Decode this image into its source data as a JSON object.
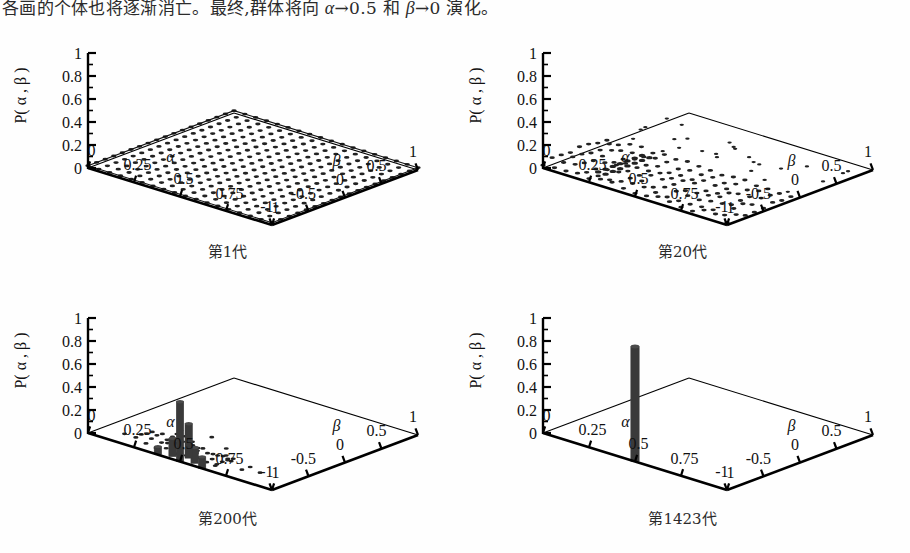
{
  "paragraph": {
    "prefix": "各画的个体也将逐渐消亡。最终,群体将向 ",
    "sym1": "α",
    "mid1": "→0.5 和 ",
    "sym2": "β",
    "mid2": "→0 演化。",
    "full_text": "各画的个体也将逐渐消亡。最终,群体将向 α→0.5 和 β→0 演化。"
  },
  "axes": {
    "z_label": "P( α , β )",
    "x_label": "α",
    "y_label": "β",
    "z_ticks": [
      "1",
      "0.8",
      "0.6",
      "0.4",
      "0.2",
      "0"
    ],
    "z_tick_values": [
      1,
      0.8,
      0.6,
      0.4,
      0.2,
      0
    ],
    "x_ticks": [
      "0",
      "0.25",
      "0.5",
      "0.75",
      "1"
    ],
    "x_tick_values": [
      0,
      0.25,
      0.5,
      0.75,
      1
    ],
    "y_ticks": [
      "-1",
      "-0.5",
      "0",
      "0.5",
      "1"
    ],
    "y_tick_values": [
      -1,
      -0.5,
      0,
      0.5,
      1
    ],
    "zlim": [
      0,
      1
    ],
    "xlim": [
      0,
      1
    ],
    "ylim": [
      -1,
      1
    ],
    "grid": false
  },
  "panels": [
    {
      "caption": "第1代",
      "generation": 1
    },
    {
      "caption": "第20代",
      "generation": 20
    },
    {
      "caption": "第200代",
      "generation": 200
    },
    {
      "caption": "第1423代",
      "generation": 1423
    }
  ],
  "colors": {
    "ink": "#111111",
    "bar_fill": "#3a3a3a",
    "marker": "#222222",
    "frame": "#000000",
    "page": "#ffffff"
  },
  "chart_data": [
    {
      "type": "bar",
      "title": "第1代",
      "xlabel": "α",
      "ylabel": "β",
      "zlabel": "P( α , β )",
      "xlim": [
        0,
        1
      ],
      "ylim": [
        -1,
        1
      ],
      "zlim": [
        0,
        1
      ],
      "grid": false,
      "description": "Uniform near-zero distribution: every (alpha,beta) cell holds the same very small probability, so the surface is a flat dotted sheet lying on the base plane.",
      "nx": 17,
      "ny": 17,
      "uniform_value": 0.02,
      "peak": {
        "alpha": null,
        "beta": null,
        "value": 0.02
      }
    },
    {
      "type": "bar",
      "title": "第20代",
      "xlabel": "α",
      "ylabel": "β",
      "zlabel": "P( α , β )",
      "xlim": [
        0,
        1
      ],
      "ylim": [
        -1,
        1
      ],
      "zlim": [
        0,
        1
      ],
      "grid": false,
      "description": "Probability mass has begun to concentrate toward smaller beta; a dense dotted patch fills the low-beta half while isolated specks remain elsewhere.",
      "nx": 17,
      "ny": 17,
      "dense_region": {
        "beta_range": [
          -1,
          -0.1
        ],
        "alpha_range": [
          0,
          1
        ],
        "value": 0.04
      },
      "sparse_specks": 26,
      "peak": {
        "alpha": 0.5,
        "beta": -0.75,
        "value": 0.1
      }
    },
    {
      "type": "bar",
      "title": "第200代",
      "xlabel": "α",
      "ylabel": "β",
      "zlabel": "P( α , β )",
      "xlim": [
        0,
        1
      ],
      "ylim": [
        -1,
        1
      ],
      "zlim": [
        0,
        1
      ],
      "grid": false,
      "description": "A sharp cluster of tall bars has formed around alpha = 0.5, beta = -1; the tallest bar reaches about 0.5 while surrounding cells keep small residual mass.",
      "bars": [
        {
          "alpha": 0.5,
          "beta": -1.0,
          "value": 0.52
        },
        {
          "alpha": 0.5,
          "beta": -0.88,
          "value": 0.3
        },
        {
          "alpha": 0.44,
          "beta": -0.95,
          "value": 0.16
        },
        {
          "alpha": 0.56,
          "beta": -0.95,
          "value": 0.14
        },
        {
          "alpha": 0.62,
          "beta": -1.0,
          "value": 0.1
        },
        {
          "alpha": 0.38,
          "beta": -1.0,
          "value": 0.07
        }
      ],
      "sparse_specks": 20,
      "peak": {
        "alpha": 0.5,
        "beta": -1.0,
        "value": 0.52
      }
    },
    {
      "type": "bar",
      "title": "第1423代",
      "xlabel": "α",
      "ylabel": "β",
      "zlabel": "P( α , β )",
      "xlim": [
        0,
        1
      ],
      "ylim": [
        -1,
        1
      ],
      "zlim": [
        0,
        1
      ],
      "grid": false,
      "description": "The population has fully converged: a single bar at alpha = 0.5, beta = -1 carries essentially all probability and reaches the top of the axis (P approximately 1).",
      "bars": [
        {
          "alpha": 0.5,
          "beta": -1.0,
          "value": 1.0
        }
      ],
      "sparse_specks": 0,
      "peak": {
        "alpha": 0.5,
        "beta": -1.0,
        "value": 1.0
      }
    }
  ]
}
